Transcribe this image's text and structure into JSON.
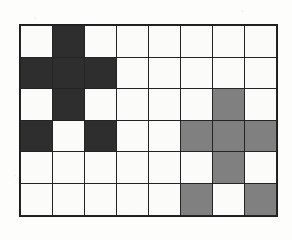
{
  "figure": {
    "rows": 6,
    "columns": 8,
    "colors": {
      "white": "#fbfbfa",
      "dark": "#2e2e2e",
      "gray": "#808080",
      "gridline": "#242424",
      "background": "#fdfdfc"
    },
    "legend": {
      "white_label": "empty",
      "dark_label": "dark-filled",
      "gray_label": "gray-filled"
    }
  },
  "chart_data": {
    "type": "heatmap",
    "title": "",
    "xlabel": "",
    "ylabel": "",
    "grid": true,
    "legend_position": "none",
    "categories_x": [
      "1",
      "2",
      "3",
      "4",
      "5",
      "6",
      "7",
      "8"
    ],
    "categories_y": [
      "1",
      "2",
      "3",
      "4",
      "5",
      "6"
    ],
    "value_map": {
      "0": "white",
      "1": "dark",
      "2": "gray"
    },
    "color_scale": [
      "#fbfbfa",
      "#2e2e2e",
      "#808080"
    ],
    "values": [
      [
        0,
        1,
        0,
        0,
        0,
        0,
        0,
        0
      ],
      [
        1,
        1,
        1,
        0,
        0,
        0,
        0,
        0
      ],
      [
        0,
        1,
        0,
        0,
        0,
        0,
        2,
        0
      ],
      [
        1,
        0,
        1,
        0,
        0,
        2,
        2,
        2
      ],
      [
        0,
        0,
        0,
        0,
        0,
        0,
        2,
        0
      ],
      [
        0,
        0,
        0,
        0,
        0,
        2,
        0,
        2
      ]
    ],
    "counts": {
      "white": 37,
      "dark": 7,
      "gray": 8,
      "total": 48
    }
  }
}
